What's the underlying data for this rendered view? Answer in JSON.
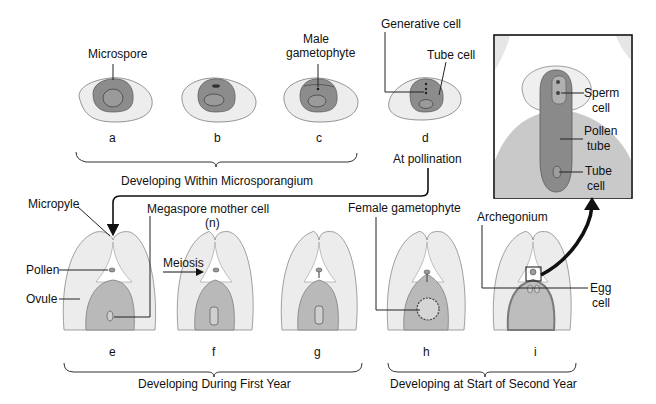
{
  "diagram": {
    "stages": [
      {
        "id": "a",
        "label": "a"
      },
      {
        "id": "b",
        "label": "b"
      },
      {
        "id": "c",
        "label": "c"
      },
      {
        "id": "d",
        "label": "d"
      },
      {
        "id": "e",
        "label": "e"
      },
      {
        "id": "f",
        "label": "f"
      },
      {
        "id": "g",
        "label": "g"
      },
      {
        "id": "h",
        "label": "h"
      },
      {
        "id": "i",
        "label": "i"
      }
    ],
    "labels": {
      "microspore": "Microspore",
      "male_gametophyte_1": "Male",
      "male_gametophyte_2": "gametophyte",
      "generative_cell": "Generative cell",
      "tube_cell_top": "Tube cell",
      "at_pollination": "At pollination",
      "micropyle": "Micropyle",
      "megaspore_mother_cell": "Megaspore mother cell",
      "n": "(n)",
      "meiosis": "Meiosis",
      "pollen": "Pollen",
      "ovule": "Ovule",
      "female_gametophyte": "Female gametophyte",
      "archegonium": "Archegonium",
      "egg_1": "Egg",
      "egg_2": "cell",
      "sperm_1": "Sperm",
      "sperm_2": "cell",
      "pollen_tube_1": "Pollen",
      "pollen_tube_2": "tube",
      "tube_cell_1": "Tube",
      "tube_cell_2": "cell"
    },
    "groups": {
      "microsporangium": "Developing Within Microsporangium",
      "first_year": "Developing During First Year",
      "second_year": "Developing at Start of Second Year"
    }
  }
}
